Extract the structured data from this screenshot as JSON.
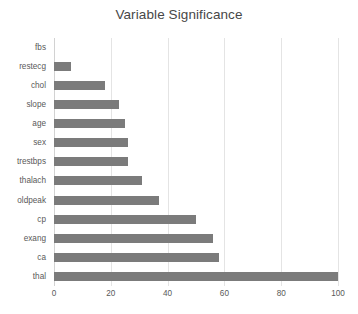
{
  "chart_data": {
    "type": "bar",
    "orientation": "horizontal",
    "title": "Variable Significance",
    "xlabel": "",
    "ylabel": "",
    "categories": [
      "fbs",
      "restecg",
      "chol",
      "slope",
      "age",
      "sex",
      "trestbps",
      "thalach",
      "oldpeak",
      "cp",
      "exang",
      "ca",
      "thal"
    ],
    "values": [
      0,
      6,
      18,
      23,
      25,
      26,
      26,
      31,
      37,
      50,
      56,
      58,
      100
    ],
    "xlim": [
      0,
      100
    ],
    "xticks": [
      0,
      20,
      40,
      60,
      80,
      100
    ],
    "xtick_labels": [
      "0",
      "20",
      "40",
      "60",
      "80",
      "100"
    ],
    "grid": "vertical",
    "legend": "none",
    "bar_color": "#7b7b7b",
    "gridline_color": "#e4e4e4",
    "title_color": "#474747",
    "tick_label_color": "#595959",
    "background": "#ffffff"
  }
}
